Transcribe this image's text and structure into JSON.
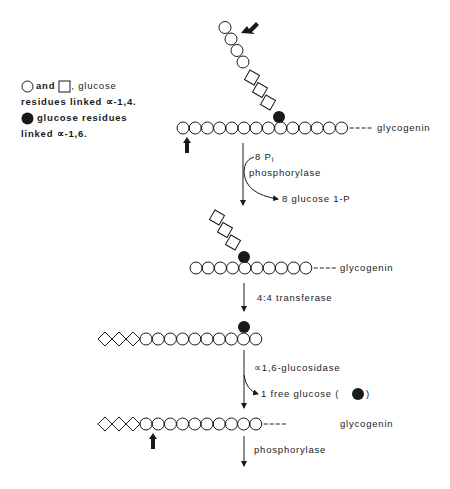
{
  "legend": {
    "line1_and": "and",
    "line1_text": ", glucose",
    "line2": "residues linked ∝-1,4.",
    "line3": "glucose residues",
    "line4": "linked ∝-1,6."
  },
  "labels": {
    "glycogenin": "glycogenin",
    "step1_reagent": "8 P",
    "step1_reagent_sub": "i",
    "step1_enzyme": "phosphorylase",
    "step1_product": "8 glucose 1-P",
    "step2_enzyme": "4:4 transferase",
    "step3_enzyme": "∝1,6-glucosidase",
    "step3_product": "1 free glucose (",
    "step3_product_close": ")",
    "step4_enzyme": "phosphorylase"
  },
  "colors": {
    "ink": "#1a1a1a",
    "background": "#ffffff"
  },
  "structures": [
    {
      "name": "initial-glycogen",
      "main_chain": {
        "x0": 183,
        "y": 128,
        "count": 14,
        "spacing": 12.2,
        "diamonds": 0
      },
      "branch_point_circle": {
        "x": 279,
        "y": 117
      },
      "branch_squares": 3,
      "branch_circles": 4,
      "has_glycogenin": true,
      "marker_arrows": [
        "up-under-chain",
        "diagonal-at-branch-tip"
      ]
    },
    {
      "name": "limit-branch",
      "main_chain": {
        "x0": 196,
        "y": 268,
        "count": 10,
        "spacing": 12.2,
        "diamonds": 0
      },
      "branch_point_circle": {
        "x": 244,
        "y": 257
      },
      "branch_squares": 3,
      "has_glycogenin": true
    },
    {
      "name": "after-transferase",
      "main_chain": {
        "x0": 146,
        "y": 339,
        "count": 10,
        "spacing": 12.2,
        "diamonds": 3
      },
      "branch_point_circle": {
        "x": 244,
        "y": 327
      },
      "has_glycogenin": false
    },
    {
      "name": "after-debranching",
      "main_chain": {
        "x0": 146,
        "y": 424,
        "count": 10,
        "spacing": 12.2,
        "diamonds": 3
      },
      "has_glycogenin": true,
      "marker_arrows": [
        "up-under-chain"
      ]
    }
  ]
}
